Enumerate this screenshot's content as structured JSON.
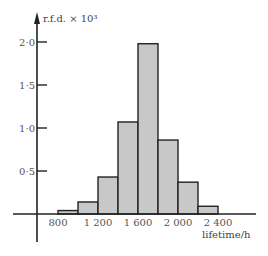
{
  "chart_data": {
    "type": "bar",
    "title": "",
    "ylabel": "r.f.d. × 10³",
    "xlabel": "lifetime/h",
    "bins": [
      {
        "from": 800,
        "to": 1000,
        "value": 0.04
      },
      {
        "from": 1000,
        "to": 1200,
        "value": 0.14
      },
      {
        "from": 1200,
        "to": 1400,
        "value": 0.43
      },
      {
        "from": 1400,
        "to": 1600,
        "value": 1.07
      },
      {
        "from": 1600,
        "to": 1800,
        "value": 1.98
      },
      {
        "from": 1800,
        "to": 2000,
        "value": 0.86
      },
      {
        "from": 2000,
        "to": 2200,
        "value": 0.37
      },
      {
        "from": 2200,
        "to": 2400,
        "value": 0.09
      }
    ],
    "categories": [
      "800-1000",
      "1000-1200",
      "1200-1400",
      "1400-1600",
      "1600-1800",
      "1800-2000",
      "2000-2200",
      "2200-2400"
    ],
    "values": [
      0.04,
      0.14,
      0.43,
      1.07,
      1.98,
      0.86,
      0.37,
      0.09
    ],
    "x_ticks": [
      {
        "value": 800,
        "label": "800"
      },
      {
        "value": 1200,
        "label": "1 200"
      },
      {
        "value": 1600,
        "label": "1 600"
      },
      {
        "value": 2000,
        "label": "2 000"
      },
      {
        "value": 2400,
        "label": "2 400"
      }
    ],
    "y_ticks": [
      {
        "value": 0.5,
        "label": "0·5"
      },
      {
        "value": 1.0,
        "label": "1·0"
      },
      {
        "value": 1.5,
        "label": "1·5"
      },
      {
        "value": 2.0,
        "label": "2·0"
      }
    ],
    "ylim": [
      0,
      2.1
    ],
    "xlim": [
      420,
      2700
    ],
    "grid": false,
    "legend": null,
    "bar_color": "#c8c8c8",
    "edge_color": "#222222"
  }
}
